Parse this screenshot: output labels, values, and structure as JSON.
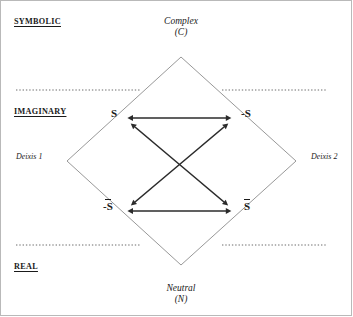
{
  "diagram": {
    "title_poles": {
      "top": {
        "name": "Complex",
        "symbol": "(C)"
      },
      "bottom": {
        "name": "Neutral",
        "symbol": "(N)"
      }
    },
    "registers": [
      {
        "key": "symbolic",
        "label": "SYMBOLIC"
      },
      {
        "key": "imaginary",
        "label": "IMAGINARY"
      },
      {
        "key": "real",
        "label": "REAL"
      }
    ],
    "deixes": [
      {
        "key": "deixis_1",
        "label": "Deixis 1"
      },
      {
        "key": "deixis_2",
        "label": "Deixis 2"
      }
    ],
    "terms": [
      {
        "key": "s1",
        "label": "S",
        "bar": false,
        "position": "upper-left"
      },
      {
        "key": "s2",
        "label": "-S",
        "bar": false,
        "position": "upper-right"
      },
      {
        "key": "not_s1",
        "label": "-S",
        "bar": true,
        "position": "lower-left"
      },
      {
        "key": "not_s2",
        "label": "S",
        "bar": true,
        "position": "lower-right"
      }
    ],
    "relations": [
      {
        "key": "contrariety-top",
        "from": "s1",
        "to": "s2",
        "style": "double-arrow"
      },
      {
        "key": "contrariety-bottom",
        "from": "not_s1",
        "to": "not_s2",
        "style": "double-arrow"
      },
      {
        "key": "contradiction-1",
        "from": "s1",
        "to": "not_s2",
        "style": "double-arrow"
      },
      {
        "key": "contradiction-2",
        "from": "s2",
        "to": "not_s1",
        "style": "double-arrow"
      }
    ],
    "colors": {
      "ink": "#1a1a1a",
      "diamond": "#8c8c8c",
      "dotted": "#6b6b6b",
      "frame": "#b9b9b9",
      "arrow": "#2b2b2b"
    }
  }
}
